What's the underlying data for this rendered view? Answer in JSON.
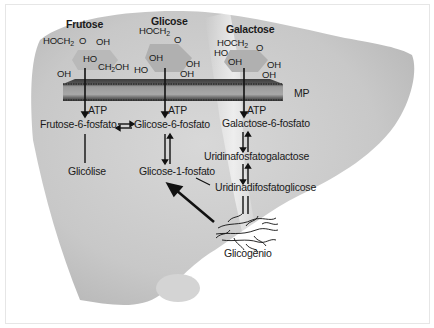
{
  "diagram": {
    "type": "metabolic-pathway",
    "sugars": [
      {
        "name": "Frutose",
        "substituents": [
          "HOCH",
          "2",
          "O",
          "OH",
          "HO",
          "CH",
          "2",
          "OH",
          "OH"
        ]
      },
      {
        "name": "Glicose",
        "substituents": [
          "HOCH",
          "2",
          "O",
          "OH",
          "HO",
          "OH",
          "OH"
        ]
      },
      {
        "name": "Galactose",
        "substituents": [
          "HOCH",
          "2",
          "O",
          "HO",
          "OH",
          "OH",
          "OH"
        ]
      }
    ],
    "membrane_label": "MP",
    "atp_label": "ATP",
    "nodes": {
      "frutose6p": "Frutose-6-fosfato",
      "glicose6p": "Glicose-6-fosfato",
      "galactose6p": "Galactose-6-fosfato",
      "glicolise": "Glicólise",
      "glicose1p": "Glicose-1-fosfato",
      "udpgal": "Uridinafosfatogalactose",
      "udpglc": "Uridinadifosfatoglicose",
      "glicogenio": "Glicogênio"
    },
    "edges": [
      {
        "from": "Frutose",
        "to": "Frutose-6-fosfato",
        "via": "ATP"
      },
      {
        "from": "Glicose",
        "to": "Glicose-6-fosfato",
        "via": "ATP"
      },
      {
        "from": "Galactose",
        "to": "Galactose-6-fosfato",
        "via": "ATP"
      },
      {
        "from": "Frutose-6-fosfato",
        "to": "Glicose-6-fosfato",
        "reversible": true
      },
      {
        "from": "Frutose-6-fosfato",
        "to": "Glicólise"
      },
      {
        "from": "Glicose-6-fosfato",
        "to": "Glicose-1-fosfato",
        "reversible": true
      },
      {
        "from": "Galactose-6-fosfato",
        "to": "Uridinafosfatogalactose",
        "reversible": true
      },
      {
        "from": "Uridinafosfatogalactose",
        "to": "Uridinadifosfatoglicose",
        "reversible": true
      },
      {
        "from": "Uridinadifosfatoglicose",
        "to": "Glicose-1-fosfato"
      },
      {
        "from": "Uridinadifosfatoglicose",
        "to": "Glicogênio"
      },
      {
        "from": "Glicogênio",
        "to": "Glicose-1-fosfato"
      }
    ],
    "colors": {
      "liver": "#c9c9c9",
      "liver_light": "#e4e4e4",
      "ring": "#b4b4b4",
      "membrane_dark": "#4a4a4a",
      "membrane_mid": "#8e8e8e",
      "text": "#1a1a1a"
    }
  }
}
